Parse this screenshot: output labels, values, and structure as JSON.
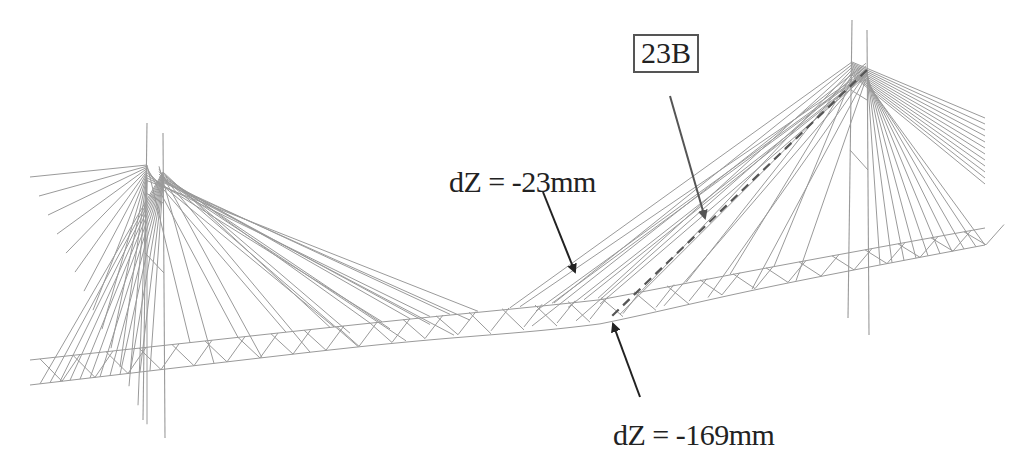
{
  "figure": {
    "labels": {
      "cable_id": "23B",
      "deflection_top": "dZ = -23mm",
      "deflection_bottom": "dZ = -169mm"
    },
    "colors": {
      "structure": "#9a9a9a",
      "dashed_cable": "#555555",
      "arrow": "#222222",
      "arrow_cable": "#555555",
      "text": "#222222"
    }
  }
}
